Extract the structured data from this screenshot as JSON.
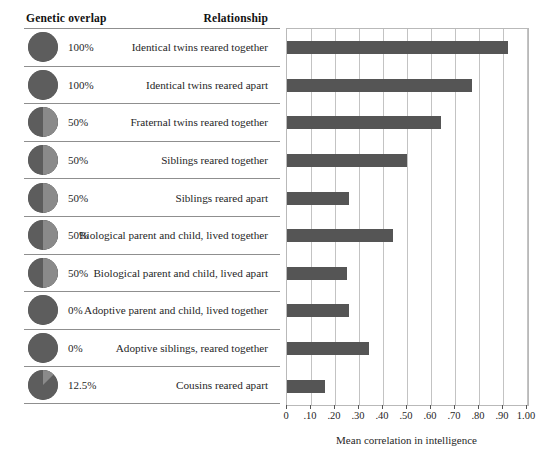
{
  "headers": {
    "genetic_overlap": "Genetic overlap",
    "relationship": "Relationship"
  },
  "axis": {
    "xlabel": "Mean correlation in intelligence",
    "ticks": [
      "0",
      ".10",
      ".20",
      ".30",
      ".40",
      ".50",
      ".60",
      ".70",
      ".80",
      ".90",
      "1.00"
    ]
  },
  "colors": {
    "bar": "#555555",
    "pie": "#5d5d5d",
    "pie_light": "#8a8a8a",
    "grid": "#c3c3c3",
    "rule": "#8f8f8f"
  },
  "chart_data": {
    "type": "bar",
    "title": "",
    "xlabel": "Mean correlation in intelligence",
    "ylabel": "Relationship",
    "xlim": [
      0,
      1.0
    ],
    "grid": true,
    "orientation": "horizontal",
    "legend": "none",
    "categories": [
      "Identical twins reared together",
      "Identical twins reared apart",
      "Fraternal twins reared together",
      "Siblings reared together",
      "Siblings reared apart",
      "Biological parent and child, lived together",
      "Biological parent and child, lived apart",
      "Adoptive parent and child, lived together",
      "Adoptive siblings, reared together",
      "Cousins reared apart"
    ],
    "values": [
      0.92,
      0.77,
      0.64,
      0.5,
      0.26,
      0.44,
      0.25,
      0.26,
      0.34,
      0.16
    ],
    "genetic_overlap": [
      "100%",
      "100%",
      "50%",
      "50%",
      "50%",
      "50%",
      "50%",
      "0%",
      "0%",
      "12.5%"
    ],
    "genetic_overlap_fraction": [
      1.0,
      1.0,
      0.5,
      0.5,
      0.5,
      0.5,
      0.5,
      0.0,
      0.0,
      0.125
    ]
  },
  "rows": [
    {
      "pct": "100%",
      "frac": 1.0,
      "rel": "Identical twins reared together",
      "value": 0.92
    },
    {
      "pct": "100%",
      "frac": 1.0,
      "rel": "Identical twins reared apart",
      "value": 0.77
    },
    {
      "pct": "50%",
      "frac": 0.5,
      "rel": "Fraternal twins reared together",
      "value": 0.64
    },
    {
      "pct": "50%",
      "frac": 0.5,
      "rel": "Siblings reared together",
      "value": 0.5
    },
    {
      "pct": "50%",
      "frac": 0.5,
      "rel": "Siblings reared apart",
      "value": 0.26
    },
    {
      "pct": "50%",
      "frac": 0.5,
      "rel": "Biological parent and child, lived together",
      "value": 0.44
    },
    {
      "pct": "50%",
      "frac": 0.5,
      "rel": "Biological parent and child, lived apart",
      "value": 0.25
    },
    {
      "pct": "0%",
      "frac": 0.0,
      "rel": "Adoptive parent and child, lived together",
      "value": 0.26
    },
    {
      "pct": "0%",
      "frac": 0.0,
      "rel": "Adoptive siblings, reared together",
      "value": 0.34
    },
    {
      "pct": "12.5%",
      "frac": 0.125,
      "rel": "Cousins reared apart",
      "value": 0.16
    }
  ]
}
